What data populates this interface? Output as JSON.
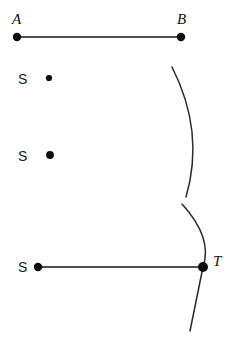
{
  "figure": {
    "background_color": "#ffffff",
    "stroke_color": "#151515",
    "labels": {
      "a": "A",
      "b": "B",
      "s_top": "S",
      "s_middle": "S",
      "s_bottom": "S",
      "t": "T"
    },
    "points": [
      {
        "name": "A",
        "label": "A",
        "x": 17,
        "y": 37,
        "radius": 4.2
      },
      {
        "name": "B",
        "label": "B",
        "x": 181,
        "y": 37,
        "radius": 4.2
      },
      {
        "name": "S-top",
        "label": "S",
        "x": 49,
        "y": 78,
        "radius": 3.1
      },
      {
        "name": "S-middle",
        "label": "S",
        "x": 50,
        "y": 155,
        "radius": 3.8
      },
      {
        "name": "S-bottom",
        "label": "S",
        "x": 38,
        "y": 267,
        "radius": 4.2
      },
      {
        "name": "T",
        "label": "T",
        "x": 203,
        "y": 267,
        "radius": 5.0
      }
    ],
    "label_positions": {
      "a": {
        "x": 12,
        "y": 24
      },
      "b": {
        "x": 177,
        "y": 24
      },
      "s_top": {
        "x": 18,
        "y": 84
      },
      "s_middle": {
        "x": 18,
        "y": 161
      },
      "s_bottom": {
        "x": 18,
        "y": 272
      },
      "t": {
        "x": 213,
        "y": 266
      }
    },
    "segments": [
      {
        "name": "segment-ab",
        "x1": 17,
        "y1": 37,
        "x2": 181,
        "y2": 37
      },
      {
        "name": "segment-st",
        "x1": 38,
        "y1": 267,
        "x2": 203,
        "y2": 267
      }
    ],
    "arcs": [
      {
        "name": "upper-arc",
        "path": "M 172 67 Q 205 132 186 197",
        "start": [
          172,
          67
        ],
        "end": [
          186,
          197
        ],
        "bulge": "right"
      },
      {
        "name": "lower-arc",
        "path": "M 182 204 Q 212 240 203 267 Q 196 302 190 331",
        "start": [
          182,
          204
        ],
        "end": [
          190,
          331
        ],
        "bulge": "right",
        "passes_through": "T"
      }
    ]
  }
}
